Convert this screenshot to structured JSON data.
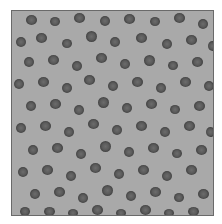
{
  "image": {
    "subject": "blood smear micrograph",
    "background_color": "#a9a9a9",
    "cell_color": "#4e4e4e",
    "frame": {
      "left": 11,
      "top": 10,
      "width": 203,
      "height": 206
    }
  },
  "cells": [
    [
      14,
      4,
      11,
      10
    ],
    [
      38,
      6,
      10,
      9
    ],
    [
      62,
      2,
      11,
      10
    ],
    [
      88,
      5,
      10,
      10
    ],
    [
      112,
      3,
      11,
      10
    ],
    [
      138,
      6,
      10,
      9
    ],
    [
      162,
      2,
      11,
      10
    ],
    [
      186,
      8,
      10,
      10
    ],
    [
      4,
      26,
      10,
      10
    ],
    [
      24,
      22,
      11,
      10
    ],
    [
      50,
      28,
      10,
      9
    ],
    [
      74,
      20,
      11,
      11
    ],
    [
      98,
      26,
      10,
      10
    ],
    [
      124,
      22,
      11,
      10
    ],
    [
      150,
      28,
      10,
      10
    ],
    [
      174,
      24,
      11,
      10
    ],
    [
      196,
      30,
      9,
      10
    ],
    [
      12,
      46,
      10,
      10
    ],
    [
      36,
      44,
      11,
      10
    ],
    [
      60,
      50,
      10,
      10
    ],
    [
      84,
      42,
      11,
      10
    ],
    [
      108,
      48,
      10,
      10
    ],
    [
      132,
      44,
      11,
      11
    ],
    [
      156,
      50,
      10,
      9
    ],
    [
      180,
      46,
      11,
      10
    ],
    [
      2,
      68,
      10,
      10
    ],
    [
      26,
      66,
      11,
      10
    ],
    [
      50,
      72,
      10,
      10
    ],
    [
      72,
      64,
      11,
      10
    ],
    [
      96,
      70,
      10,
      10
    ],
    [
      120,
      66,
      11,
      10
    ],
    [
      144,
      72,
      10,
      10
    ],
    [
      168,
      66,
      11,
      10
    ],
    [
      192,
      70,
      10,
      10
    ],
    [
      14,
      90,
      10,
      10
    ],
    [
      38,
      88,
      11,
      10
    ],
    [
      62,
      94,
      10,
      10
    ],
    [
      86,
      86,
      11,
      11
    ],
    [
      110,
      92,
      10,
      10
    ],
    [
      134,
      88,
      11,
      10
    ],
    [
      158,
      94,
      10,
      9
    ],
    [
      182,
      90,
      11,
      10
    ],
    [
      4,
      112,
      10,
      10
    ],
    [
      28,
      110,
      11,
      10
    ],
    [
      52,
      116,
      10,
      10
    ],
    [
      76,
      108,
      11,
      10
    ],
    [
      100,
      114,
      10,
      10
    ],
    [
      124,
      110,
      11,
      10
    ],
    [
      148,
      116,
      10,
      10
    ],
    [
      172,
      110,
      11,
      10
    ],
    [
      194,
      116,
      9,
      10
    ],
    [
      16,
      134,
      10,
      10
    ],
    [
      40,
      132,
      11,
      10
    ],
    [
      64,
      138,
      10,
      10
    ],
    [
      88,
      130,
      11,
      11
    ],
    [
      112,
      136,
      10,
      10
    ],
    [
      136,
      132,
      11,
      10
    ],
    [
      160,
      138,
      10,
      9
    ],
    [
      184,
      134,
      11,
      10
    ],
    [
      6,
      156,
      10,
      10
    ],
    [
      30,
      154,
      11,
      10
    ],
    [
      54,
      160,
      10,
      10
    ],
    [
      78,
      152,
      11,
      10
    ],
    [
      102,
      158,
      10,
      10
    ],
    [
      126,
      154,
      11,
      10
    ],
    [
      150,
      160,
      10,
      10
    ],
    [
      174,
      154,
      11,
      10
    ],
    [
      18,
      178,
      10,
      10
    ],
    [
      42,
      176,
      11,
      10
    ],
    [
      66,
      182,
      10,
      10
    ],
    [
      90,
      174,
      11,
      11
    ],
    [
      114,
      180,
      10,
      10
    ],
    [
      138,
      176,
      11,
      10
    ],
    [
      162,
      182,
      10,
      9
    ],
    [
      186,
      178,
      11,
      10
    ],
    [
      8,
      196,
      10,
      9
    ],
    [
      32,
      196,
      11,
      9
    ],
    [
      56,
      198,
      10,
      8
    ],
    [
      80,
      194,
      11,
      10
    ],
    [
      104,
      198,
      10,
      8
    ],
    [
      128,
      194,
      11,
      10
    ],
    [
      152,
      198,
      10,
      8
    ],
    [
      176,
      196,
      11,
      9
    ]
  ]
}
